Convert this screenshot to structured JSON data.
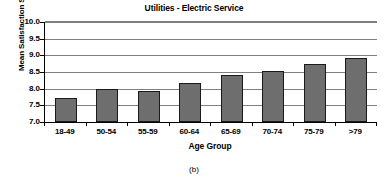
{
  "caption": "(b)",
  "chart_data": {
    "type": "bar",
    "title": "Utilities - Electric Service",
    "xlabel": "Age Group",
    "ylabel": "Mean Satisfaction Score",
    "categories": [
      "18-49",
      "50-54",
      "55-59",
      "60-64",
      "65-69",
      "70-74",
      "75-79",
      ">79"
    ],
    "values": [
      7.73,
      7.99,
      7.93,
      8.16,
      8.42,
      8.52,
      8.74,
      8.92
    ],
    "ylim": [
      7.0,
      10.0
    ],
    "yticks": [
      7.0,
      7.5,
      8.0,
      8.5,
      9.0,
      9.5,
      10.0
    ],
    "ytick_labels": [
      "7.0",
      "7.5",
      "8.0",
      "8.5",
      "9.0",
      "9.5",
      "10.0"
    ],
    "grid": "horizontal",
    "legend": "none",
    "bar_color": "#6e6e6e",
    "bar_edge_color": "#1a1a1a",
    "gridline_color": "#808080",
    "axis_color": "#000000"
  }
}
